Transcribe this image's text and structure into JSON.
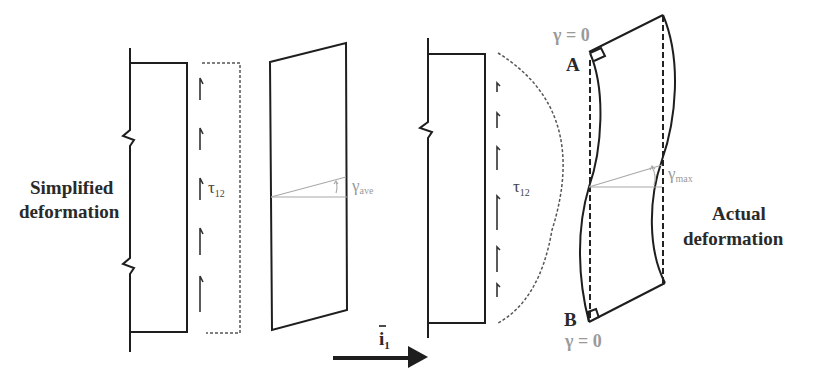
{
  "labels": {
    "simplified_line1": "Simplified",
    "simplified_line2": "deformation",
    "actual_line1": "Actual",
    "actual_line2": "deformation",
    "tau": "τ",
    "tau_sub": "12",
    "gamma": "γ",
    "gamma_ave_sub": "ave",
    "gamma_max_sub": "max",
    "point_a": "A",
    "point_b": "B",
    "gamma_zero_top": "γ = 0",
    "gamma_zero_bottom": "γ = 0",
    "axis_vector": "i",
    "axis_vector_sub": "1",
    "axis_vector_bar": "‾"
  },
  "colors": {
    "line": "#1e1e1e",
    "gray_annotation": "#9a9a9a",
    "background": "#ffffff"
  }
}
